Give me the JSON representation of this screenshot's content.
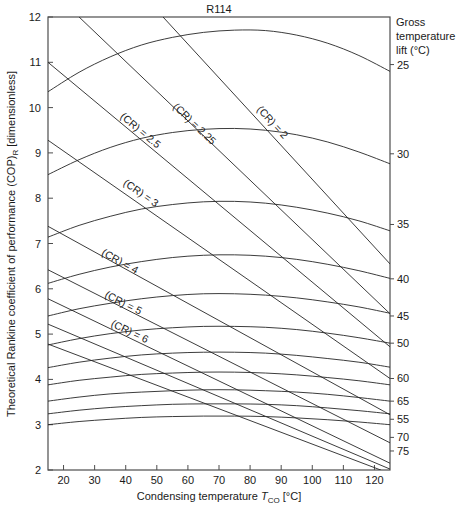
{
  "chart_data": {
    "type": "line",
    "title": "R114",
    "xlabel": "Condensing temperature T_CO [°C]",
    "ylabel": "Theoretical Rankine coefficient of performance (COP)_R [dimensionless]",
    "xlim": [
      15,
      125
    ],
    "ylim": [
      2,
      12
    ],
    "xticks": [
      20,
      30,
      40,
      50,
      60,
      70,
      80,
      90,
      100,
      110,
      120
    ],
    "yticks": [
      2,
      3,
      4,
      5,
      6,
      7,
      8,
      9,
      10,
      11,
      12
    ],
    "grid": false,
    "legend_position": "right-axis-annotations",
    "right_axis_title": "Gross temperature lift (°C)",
    "series": [
      {
        "name": "25",
        "label": "25",
        "label_y": 10.95,
        "points": [
          {
            "x": 15,
            "y": 10.35
          },
          {
            "x": 25,
            "y": 10.78
          },
          {
            "x": 35,
            "y": 11.12
          },
          {
            "x": 45,
            "y": 11.38
          },
          {
            "x": 55,
            "y": 11.55
          },
          {
            "x": 65,
            "y": 11.66
          },
          {
            "x": 75,
            "y": 11.71
          },
          {
            "x": 85,
            "y": 11.7
          },
          {
            "x": 95,
            "y": 11.6
          },
          {
            "x": 105,
            "y": 11.42
          },
          {
            "x": 115,
            "y": 11.15
          },
          {
            "x": 125,
            "y": 10.8
          }
        ]
      },
      {
        "name": "30",
        "label": "30",
        "label_y": 8.98,
        "points": [
          {
            "x": 15,
            "y": 8.52
          },
          {
            "x": 25,
            "y": 8.85
          },
          {
            "x": 35,
            "y": 9.12
          },
          {
            "x": 45,
            "y": 9.32
          },
          {
            "x": 55,
            "y": 9.45
          },
          {
            "x": 65,
            "y": 9.52
          },
          {
            "x": 75,
            "y": 9.54
          },
          {
            "x": 85,
            "y": 9.5
          },
          {
            "x": 95,
            "y": 9.4
          },
          {
            "x": 105,
            "y": 9.24
          },
          {
            "x": 115,
            "y": 9.02
          },
          {
            "x": 125,
            "y": 8.76
          }
        ]
      },
      {
        "name": "35",
        "label": "35",
        "label_y": 7.42,
        "points": [
          {
            "x": 15,
            "y": 7.14
          },
          {
            "x": 25,
            "y": 7.4
          },
          {
            "x": 35,
            "y": 7.6
          },
          {
            "x": 45,
            "y": 7.76
          },
          {
            "x": 55,
            "y": 7.86
          },
          {
            "x": 65,
            "y": 7.92
          },
          {
            "x": 75,
            "y": 7.93
          },
          {
            "x": 85,
            "y": 7.89
          },
          {
            "x": 95,
            "y": 7.8
          },
          {
            "x": 105,
            "y": 7.67
          },
          {
            "x": 115,
            "y": 7.5
          },
          {
            "x": 125,
            "y": 7.28
          }
        ]
      },
      {
        "name": "40",
        "label": "40",
        "label_y": 6.22,
        "points": [
          {
            "x": 15,
            "y": 6.12
          },
          {
            "x": 25,
            "y": 6.32
          },
          {
            "x": 35,
            "y": 6.48
          },
          {
            "x": 45,
            "y": 6.6
          },
          {
            "x": 55,
            "y": 6.69
          },
          {
            "x": 65,
            "y": 6.74
          },
          {
            "x": 75,
            "y": 6.75
          },
          {
            "x": 85,
            "y": 6.72
          },
          {
            "x": 95,
            "y": 6.65
          },
          {
            "x": 105,
            "y": 6.54
          },
          {
            "x": 115,
            "y": 6.4
          },
          {
            "x": 125,
            "y": 6.23
          }
        ]
      },
      {
        "name": "45",
        "label": "45",
        "label_y": 5.4,
        "points": [
          {
            "x": 15,
            "y": 5.4
          },
          {
            "x": 25,
            "y": 5.56
          },
          {
            "x": 35,
            "y": 5.68
          },
          {
            "x": 45,
            "y": 5.78
          },
          {
            "x": 55,
            "y": 5.85
          },
          {
            "x": 65,
            "y": 5.89
          },
          {
            "x": 75,
            "y": 5.89
          },
          {
            "x": 85,
            "y": 5.86
          },
          {
            "x": 95,
            "y": 5.8
          },
          {
            "x": 105,
            "y": 5.71
          },
          {
            "x": 115,
            "y": 5.6
          },
          {
            "x": 125,
            "y": 5.46
          }
        ]
      },
      {
        "name": "50",
        "label": "50",
        "label_y": 4.8,
        "points": [
          {
            "x": 15,
            "y": 4.76
          },
          {
            "x": 25,
            "y": 4.9
          },
          {
            "x": 35,
            "y": 5.01
          },
          {
            "x": 45,
            "y": 5.09
          },
          {
            "x": 55,
            "y": 5.14
          },
          {
            "x": 65,
            "y": 5.17
          },
          {
            "x": 75,
            "y": 5.17
          },
          {
            "x": 85,
            "y": 5.15
          },
          {
            "x": 95,
            "y": 5.1
          },
          {
            "x": 105,
            "y": 5.02
          },
          {
            "x": 115,
            "y": 4.92
          },
          {
            "x": 125,
            "y": 4.8
          }
        ]
      },
      {
        "name": "60",
        "label": "60",
        "label_y": 4.02,
        "points": [
          {
            "x": 15,
            "y": 4.26
          },
          {
            "x": 25,
            "y": 4.38
          },
          {
            "x": 35,
            "y": 4.47
          },
          {
            "x": 45,
            "y": 4.54
          },
          {
            "x": 55,
            "y": 4.58
          },
          {
            "x": 65,
            "y": 4.6
          },
          {
            "x": 75,
            "y": 4.6
          },
          {
            "x": 85,
            "y": 4.58
          },
          {
            "x": 95,
            "y": 4.53
          },
          {
            "x": 105,
            "y": 4.46
          },
          {
            "x": 115,
            "y": 4.38
          },
          {
            "x": 125,
            "y": 4.27
          }
        ]
      },
      {
        "name": "65",
        "label": "65",
        "label_y": 3.52,
        "points": [
          {
            "x": 15,
            "y": 3.88
          },
          {
            "x": 25,
            "y": 3.98
          },
          {
            "x": 35,
            "y": 4.05
          },
          {
            "x": 45,
            "y": 4.11
          },
          {
            "x": 55,
            "y": 4.14
          },
          {
            "x": 65,
            "y": 4.16
          },
          {
            "x": 75,
            "y": 4.16
          },
          {
            "x": 85,
            "y": 4.14
          },
          {
            "x": 95,
            "y": 4.1
          },
          {
            "x": 105,
            "y": 4.04
          },
          {
            "x": 115,
            "y": 3.97
          },
          {
            "x": 125,
            "y": 3.88
          }
        ]
      },
      {
        "name": "55",
        "label": "55",
        "label_y": 3.12,
        "points": [
          {
            "x": 15,
            "y": 3.52
          },
          {
            "x": 25,
            "y": 3.61
          },
          {
            "x": 35,
            "y": 3.68
          },
          {
            "x": 45,
            "y": 3.72
          },
          {
            "x": 55,
            "y": 3.75
          },
          {
            "x": 65,
            "y": 3.77
          },
          {
            "x": 75,
            "y": 3.77
          },
          {
            "x": 85,
            "y": 3.75
          },
          {
            "x": 95,
            "y": 3.72
          },
          {
            "x": 105,
            "y": 3.67
          },
          {
            "x": 115,
            "y": 3.6
          },
          {
            "x": 125,
            "y": 3.52
          }
        ]
      },
      {
        "name": "70",
        "label": "70",
        "label_y": 2.72,
        "points": [
          {
            "x": 15,
            "y": 3.24
          },
          {
            "x": 25,
            "y": 3.32
          },
          {
            "x": 35,
            "y": 3.38
          },
          {
            "x": 45,
            "y": 3.42
          },
          {
            "x": 55,
            "y": 3.45
          },
          {
            "x": 65,
            "y": 3.46
          },
          {
            "x": 75,
            "y": 3.46
          },
          {
            "x": 85,
            "y": 3.45
          },
          {
            "x": 95,
            "y": 3.42
          },
          {
            "x": 105,
            "y": 3.37
          },
          {
            "x": 115,
            "y": 3.31
          },
          {
            "x": 125,
            "y": 3.24
          }
        ]
      },
      {
        "name": "75",
        "label": "75",
        "label_y": 2.42,
        "points": [
          {
            "x": 15,
            "y": 3.0
          },
          {
            "x": 25,
            "y": 3.07
          },
          {
            "x": 35,
            "y": 3.12
          },
          {
            "x": 45,
            "y": 3.16
          },
          {
            "x": 55,
            "y": 3.18
          },
          {
            "x": 65,
            "y": 3.19
          },
          {
            "x": 75,
            "y": 3.19
          },
          {
            "x": 85,
            "y": 3.18
          },
          {
            "x": 95,
            "y": 3.15
          },
          {
            "x": 105,
            "y": 3.11
          },
          {
            "x": 115,
            "y": 3.06
          },
          {
            "x": 125,
            "y": 3.0
          }
        ]
      }
    ],
    "cr_lines": [
      {
        "label": "(CR) = 2",
        "x1": 52,
        "y1": 12.0,
        "x2": 125,
        "y2": 6.55,
        "label_x": 82,
        "label_y": 9.95
      },
      {
        "label": "(CR) = 2.25",
        "x1": 25,
        "y1": 12.0,
        "x2": 125,
        "y2": 5.45,
        "label_x": 55,
        "label_y": 10.0
      },
      {
        "label": "(CR) = 2.5",
        "x1": 15,
        "y1": 11.0,
        "x2": 125,
        "y2": 4.72,
        "label_x": 38,
        "label_y": 9.78
      },
      {
        "label": "(CR) = 3",
        "x1": 15,
        "y1": 9.28,
        "x2": 125,
        "y2": 4.02,
        "label_x": 39,
        "label_y": 8.3
      },
      {
        "label": "(CR) = 4",
        "x1": 15,
        "y1": 7.38,
        "x2": 125,
        "y2": 3.22,
        "label_x": 32,
        "label_y": 6.75
      },
      {
        "label": "(CR) = 5",
        "x1": 15,
        "y1": 6.42,
        "x2": 125,
        "y2": 2.6,
        "label_x": 33,
        "label_y": 5.82
      },
      {
        "label": "(CR) = 6",
        "x1": 15,
        "y1": 5.78,
        "x2": 125,
        "y2": 2.15,
        "label_x": 35,
        "label_y": 5.18
      }
    ],
    "extra_cr_lines": [
      {
        "x1": 15,
        "y1": 5.22,
        "x2": 125,
        "y2": 2.02
      },
      {
        "x1": 15,
        "y1": 4.78,
        "x2": 122,
        "y2": 2.0
      }
    ]
  },
  "axes": {
    "title": "R114",
    "x_title_prefix": "Condensing temperature ",
    "x_title_symbol": "T",
    "x_title_subscript": "CO",
    "x_title_suffix": " [°C]",
    "y_title_prefix": "Theoretical Rankine coefficient of performance (COP)",
    "y_title_subscript": "R",
    "y_title_suffix": " [dimensionless]",
    "right_legend_line1": "Gross",
    "right_legend_line2": "temperature",
    "right_legend_line3": "lift (°C)"
  },
  "colors": {
    "axis": "#4d4d4d",
    "curve": "#262626",
    "text": "#1a1a1a",
    "background": "#ffffff"
  }
}
